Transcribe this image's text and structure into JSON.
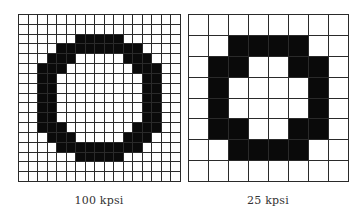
{
  "figures": [
    {
      "id": "hi",
      "label": "100 kpsi",
      "cols": 17,
      "rows": 17,
      "black_cells": [
        [],
        [],
        [
          6,
          7,
          8,
          9,
          10
        ],
        [
          4,
          5,
          6,
          7,
          8,
          9,
          10,
          11,
          12
        ],
        [
          3,
          4,
          5,
          11,
          12,
          13
        ],
        [
          2,
          3,
          4,
          12,
          13,
          14
        ],
        [
          2,
          3,
          13,
          14
        ],
        [
          2,
          3,
          13,
          14
        ],
        [
          2,
          3,
          13,
          14
        ],
        [
          2,
          3,
          13,
          14
        ],
        [
          2,
          3,
          13,
          14
        ],
        [
          2,
          3,
          4,
          12,
          13,
          14
        ],
        [
          3,
          4,
          5,
          11,
          12,
          13
        ],
        [
          4,
          5,
          6,
          7,
          8,
          9,
          10,
          11,
          12
        ],
        [
          6,
          7,
          8,
          9,
          10
        ],
        [],
        []
      ]
    },
    {
      "id": "lo",
      "label": "25 kpsi",
      "cols": 8,
      "rows": 8,
      "black_cells": [
        [],
        [
          2,
          3,
          4,
          5
        ],
        [
          1,
          2,
          5,
          6
        ],
        [
          1,
          6
        ],
        [
          1,
          6
        ],
        [
          1,
          2,
          5,
          6
        ],
        [
          2,
          3,
          4,
          5
        ],
        []
      ]
    }
  ],
  "colors": {
    "ink": "#0a0a0a",
    "grid_line": "#2a2a2a",
    "background": "#ffffff"
  }
}
